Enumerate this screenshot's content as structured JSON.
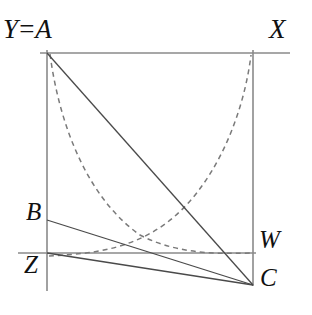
{
  "figure": {
    "width": 312,
    "height": 315,
    "background_color": "#ffffff",
    "line_color": "#555555",
    "solid_line_color": "#444444",
    "dashed_line_color": "#777777",
    "label_color": "#111111"
  },
  "labels": {
    "y_equals_a": "Y=A",
    "x": "X",
    "b": "B",
    "z": "Z",
    "w": "W",
    "c": "C"
  },
  "points": {
    "A": {
      "x": 47,
      "y": 53
    },
    "X": {
      "x": 253,
      "y": 53
    },
    "B": {
      "x": 47,
      "y": 220
    },
    "Z": {
      "x": 47,
      "y": 253
    },
    "W": {
      "x": 253,
      "y": 253
    },
    "C": {
      "x": 253,
      "y": 285
    }
  },
  "segments": {
    "top_axis": {
      "x1": 40,
      "y1": 53,
      "x2": 290,
      "y2": 53,
      "style": "solid"
    },
    "left_axis": {
      "x1": 47,
      "y1": 50,
      "x2": 47,
      "y2": 291,
      "style": "solid"
    },
    "right_axis": {
      "x1": 253,
      "y1": 50,
      "x2": 253,
      "y2": 286,
      "style": "solid"
    },
    "bottom_axis": {
      "x1": 18,
      "y1": 253,
      "x2": 256,
      "y2": 253,
      "style": "solid"
    },
    "A_to_C": {
      "x1": 47,
      "y1": 53,
      "x2": 253,
      "y2": 285,
      "style": "solid"
    },
    "B_to_C": {
      "x1": 47,
      "y1": 220,
      "x2": 253,
      "y2": 285,
      "style": "solid"
    },
    "Z_to_C": {
      "x1": 47,
      "y1": 253,
      "x2": 253,
      "y2": 285,
      "style": "solid"
    }
  },
  "curves": {
    "descending_dashed": {
      "description": "convex decreasing dashed curve from A down to W",
      "path": "M 50 54 C 60 130 90 200 140 235 C 180 256 225 253 252 253",
      "style": "dashed"
    },
    "ascending_dashed": {
      "description": "convex increasing dashed curve mirrored, from Z region up to X",
      "path": "M 49 256 C 80 254 125 253 165 224 C 212 190 243 120 251 55",
      "style": "dashed"
    }
  }
}
